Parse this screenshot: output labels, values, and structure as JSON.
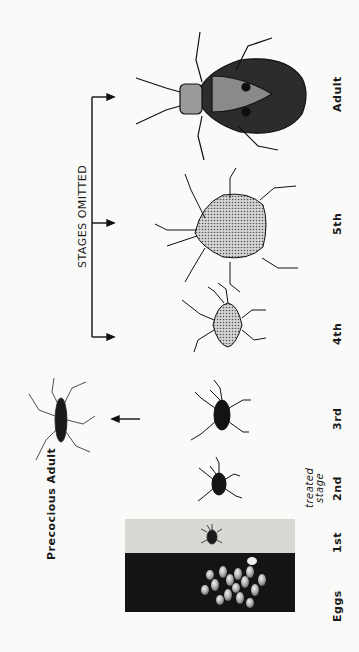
{
  "figure": {
    "orientation": "rotated-90-ccw",
    "stage_labels": [
      {
        "id": "eggs",
        "text": "Eggs"
      },
      {
        "id": "first",
        "text": "1st"
      },
      {
        "id": "second",
        "text": "2nd"
      },
      {
        "id": "third",
        "text": "3rd"
      },
      {
        "id": "fourth",
        "text": "4th"
      },
      {
        "id": "fifth",
        "text": "5th"
      },
      {
        "id": "adult",
        "text": "Adult"
      }
    ],
    "treated_stage_note": {
      "line1": "treated",
      "line2": "stage"
    },
    "bracket_label": "STAGES OMITTED",
    "precocious_label": "Precocious Adult",
    "colors": {
      "background": "#fafaf8",
      "ink": "#1a1a1a",
      "stipple": "#b8b8b8",
      "photo_light": "#d8d8d4",
      "photo_dark": "#141414"
    }
  }
}
